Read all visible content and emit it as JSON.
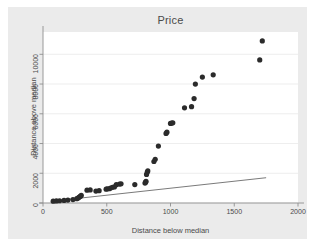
{
  "chart_data": {
    "type": "scatter",
    "title": "Price",
    "xlabel": "Distance below median",
    "ylabel": "Distance above median",
    "xlim": [
      0,
      2000
    ],
    "ylim": [
      0,
      11500
    ],
    "xticks": [
      0,
      500,
      1000,
      1500,
      2000
    ],
    "xtick_labels": [
      "0",
      "500",
      "1000",
      "1500",
      "2000"
    ],
    "yticks": [
      0,
      2000,
      4000,
      6000,
      8000,
      10000
    ],
    "ytick_labels": [
      "0",
      "2000",
      "4000",
      "6000",
      "8000",
      "10000"
    ],
    "grid": "horizontal",
    "legend": "none",
    "marker_color": "#2b2b2b",
    "marker_size": 2.6,
    "plot_background": "#ffffff",
    "figure_background": "#ebebeb",
    "series": [
      {
        "name": "observations",
        "kind": "scatter",
        "points": [
          [
            80,
            120
          ],
          [
            105,
            140
          ],
          [
            130,
            150
          ],
          [
            165,
            175
          ],
          [
            195,
            200
          ],
          [
            235,
            230
          ],
          [
            265,
            290
          ],
          [
            275,
            330
          ],
          [
            282,
            380
          ],
          [
            290,
            430
          ],
          [
            296,
            470
          ],
          [
            300,
            520
          ],
          [
            345,
            860
          ],
          [
            370,
            880
          ],
          [
            415,
            800
          ],
          [
            440,
            830
          ],
          [
            495,
            930
          ],
          [
            505,
            960
          ],
          [
            520,
            960
          ],
          [
            530,
            1010
          ],
          [
            545,
            1060
          ],
          [
            560,
            1080
          ],
          [
            575,
            1230
          ],
          [
            600,
            1270
          ],
          [
            612,
            1290
          ],
          [
            720,
            1240
          ],
          [
            800,
            1340
          ],
          [
            805,
            1400
          ],
          [
            808,
            1460
          ],
          [
            812,
            1920
          ],
          [
            818,
            2080
          ],
          [
            822,
            2160
          ],
          [
            870,
            2790
          ],
          [
            880,
            2940
          ],
          [
            905,
            3830
          ],
          [
            965,
            4680
          ],
          [
            972,
            4760
          ],
          [
            1000,
            5350
          ],
          [
            1010,
            5380
          ],
          [
            1018,
            5390
          ],
          [
            1110,
            6400
          ],
          [
            1165,
            6480
          ],
          [
            1185,
            7020
          ],
          [
            1195,
            8000
          ],
          [
            1250,
            8470
          ],
          [
            1335,
            8620
          ],
          [
            1700,
            9620
          ],
          [
            1720,
            10900
          ]
        ]
      },
      {
        "name": "reference-line",
        "kind": "line",
        "points": [
          [
            70,
            120
          ],
          [
            1750,
            1700
          ]
        ]
      }
    ]
  }
}
